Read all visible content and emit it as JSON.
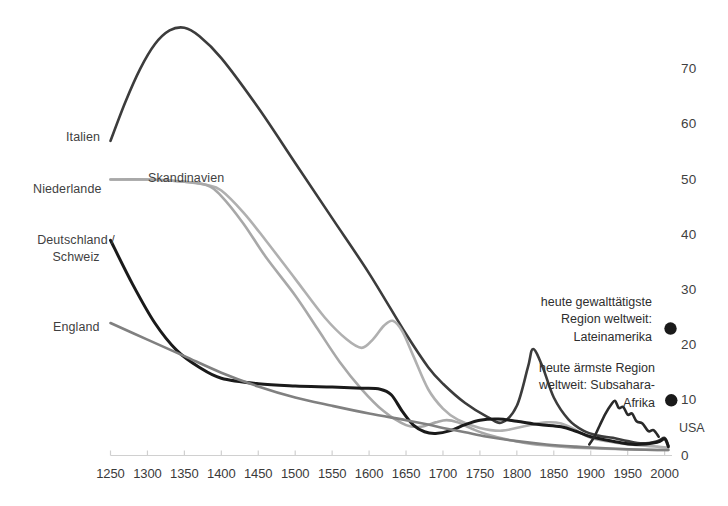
{
  "chart_data": {
    "type": "line",
    "title": "",
    "subtitle": "",
    "xlabel": "",
    "ylabel": "",
    "xlim": [
      1250,
      2010
    ],
    "ylim": [
      0,
      75
    ],
    "grid": false,
    "legend_position": "inline-labels",
    "x_ticks": [
      1250,
      1300,
      1350,
      1400,
      1450,
      1500,
      1550,
      1600,
      1650,
      1700,
      1750,
      1800,
      1850,
      1900,
      1950,
      2000
    ],
    "y_ticks": [
      0,
      10,
      20,
      30,
      40,
      50,
      60,
      70
    ],
    "series": [
      {
        "name": "Italien",
        "color": "#3c3c3c",
        "width": 2.6,
        "label_position": "left",
        "points": [
          [
            1250,
            57
          ],
          [
            1270,
            64
          ],
          [
            1290,
            70
          ],
          [
            1310,
            74.5
          ],
          [
            1330,
            77
          ],
          [
            1350,
            77.5
          ],
          [
            1370,
            76
          ],
          [
            1400,
            72
          ],
          [
            1450,
            63
          ],
          [
            1500,
            53
          ],
          [
            1550,
            43
          ],
          [
            1600,
            33
          ],
          [
            1650,
            22
          ],
          [
            1680,
            16
          ],
          [
            1700,
            13
          ],
          [
            1730,
            9.5
          ],
          [
            1760,
            7
          ],
          [
            1780,
            6
          ],
          [
            1800,
            9
          ],
          [
            1815,
            16
          ],
          [
            1822,
            19.3
          ],
          [
            1835,
            16
          ],
          [
            1850,
            10.5
          ],
          [
            1870,
            6.5
          ],
          [
            1890,
            4.5
          ],
          [
            1910,
            3.6
          ],
          [
            1930,
            3.2
          ],
          [
            1950,
            2.6
          ],
          [
            1970,
            2.2
          ],
          [
            1990,
            2.6
          ],
          [
            2000,
            3.2
          ],
          [
            2005,
            1.8
          ]
        ]
      },
      {
        "name": "Skandinavien",
        "color": "#b0b0b0",
        "width": 2.6,
        "label_position": "above",
        "points": [
          [
            1250,
            50
          ],
          [
            1300,
            50
          ],
          [
            1350,
            49.6
          ],
          [
            1380,
            49
          ],
          [
            1400,
            48
          ],
          [
            1430,
            44
          ],
          [
            1460,
            39
          ],
          [
            1500,
            32
          ],
          [
            1540,
            25
          ],
          [
            1570,
            21
          ],
          [
            1590,
            19.5
          ],
          [
            1605,
            21
          ],
          [
            1620,
            23.5
          ],
          [
            1632,
            24.4
          ],
          [
            1645,
            22.5
          ],
          [
            1660,
            18
          ],
          [
            1680,
            12
          ],
          [
            1700,
            8.5
          ],
          [
            1720,
            6.5
          ],
          [
            1750,
            5
          ],
          [
            1780,
            4.5
          ],
          [
            1810,
            5.3
          ],
          [
            1840,
            6
          ],
          [
            1860,
            5.8
          ],
          [
            1880,
            4.6
          ],
          [
            1900,
            3.2
          ],
          [
            1930,
            2.4
          ],
          [
            1960,
            1.9
          ],
          [
            1990,
            1.6
          ],
          [
            2005,
            1.4
          ]
        ]
      },
      {
        "name": "Niederlande",
        "color": "#a8a8a8",
        "width": 2.6,
        "label_position": "left",
        "points": [
          [
            1250,
            50
          ],
          [
            1300,
            50
          ],
          [
            1350,
            49.6
          ],
          [
            1380,
            49
          ],
          [
            1400,
            47
          ],
          [
            1430,
            42
          ],
          [
            1460,
            36
          ],
          [
            1500,
            29
          ],
          [
            1530,
            23
          ],
          [
            1560,
            17
          ],
          [
            1590,
            12
          ],
          [
            1620,
            8
          ],
          [
            1650,
            5.5
          ],
          [
            1670,
            5.2
          ],
          [
            1690,
            6.0
          ],
          [
            1705,
            6.4
          ],
          [
            1720,
            6.0
          ],
          [
            1740,
            4.8
          ],
          [
            1760,
            3.8
          ],
          [
            1790,
            2.8
          ],
          [
            1820,
            2.1
          ],
          [
            1860,
            1.6
          ],
          [
            1900,
            1.3
          ],
          [
            1950,
            1.1
          ],
          [
            1990,
            1.0
          ],
          [
            2005,
            1.0
          ]
        ]
      },
      {
        "name": "Deutschland / Schweiz",
        "color": "#1a1a1a",
        "width": 3.0,
        "label_position": "left",
        "points": [
          [
            1250,
            39
          ],
          [
            1280,
            31
          ],
          [
            1310,
            24
          ],
          [
            1340,
            19
          ],
          [
            1370,
            16
          ],
          [
            1400,
            14
          ],
          [
            1450,
            13
          ],
          [
            1500,
            12.6
          ],
          [
            1550,
            12.4
          ],
          [
            1590,
            12.2
          ],
          [
            1615,
            12.0
          ],
          [
            1630,
            11.0
          ],
          [
            1645,
            8.0
          ],
          [
            1660,
            5.5
          ],
          [
            1675,
            4.3
          ],
          [
            1690,
            4.0
          ],
          [
            1710,
            4.5
          ],
          [
            1730,
            5.6
          ],
          [
            1750,
            6.4
          ],
          [
            1775,
            6.6
          ],
          [
            1800,
            6.2
          ],
          [
            1830,
            5.6
          ],
          [
            1860,
            5.2
          ],
          [
            1880,
            4.4
          ],
          [
            1900,
            3.4
          ],
          [
            1930,
            2.6
          ],
          [
            1960,
            2.0
          ],
          [
            1990,
            2.4
          ],
          [
            2000,
            3.0
          ],
          [
            2005,
            1.6
          ]
        ]
      },
      {
        "name": "England",
        "color": "#808080",
        "width": 2.6,
        "label_position": "left",
        "points": [
          [
            1250,
            24
          ],
          [
            1300,
            21
          ],
          [
            1350,
            18
          ],
          [
            1400,
            15
          ],
          [
            1450,
            12.5
          ],
          [
            1500,
            10.5
          ],
          [
            1550,
            9.0
          ],
          [
            1600,
            7.6
          ],
          [
            1650,
            6.4
          ],
          [
            1680,
            5.6
          ],
          [
            1700,
            5.0
          ],
          [
            1730,
            4.2
          ],
          [
            1760,
            3.4
          ],
          [
            1800,
            2.6
          ],
          [
            1840,
            2.0
          ],
          [
            1880,
            1.6
          ],
          [
            1920,
            1.3
          ],
          [
            1960,
            1.1
          ],
          [
            1990,
            1.0
          ],
          [
            2005,
            1.0
          ]
        ]
      },
      {
        "name": "USA",
        "color": "#2a2a2a",
        "width": 2.6,
        "label_position": "right",
        "points": [
          [
            1898,
            2.0
          ],
          [
            1905,
            3.4
          ],
          [
            1912,
            5.4
          ],
          [
            1920,
            7.6
          ],
          [
            1928,
            9.3
          ],
          [
            1933,
            9.9
          ],
          [
            1938,
            8.6
          ],
          [
            1944,
            8.8
          ],
          [
            1950,
            7.4
          ],
          [
            1956,
            7.6
          ],
          [
            1962,
            6.2
          ],
          [
            1970,
            5.8
          ],
          [
            1978,
            4.4
          ],
          [
            1985,
            4.6
          ],
          [
            1992,
            3.4
          ]
        ]
      }
    ],
    "annotations": [
      {
        "id": "lateinamerika",
        "lines": [
          "heute gewalttätigste",
          "Region weltweit:",
          "Lateinamerika"
        ],
        "marker": "dot",
        "marker_color": "#1a1a1a",
        "value": 23,
        "value_year": 2008
      },
      {
        "id": "subsahara",
        "lines": [
          "heute ärmste Region",
          "weltweit: Subsahara-",
          "Afrika"
        ],
        "marker": "dot",
        "marker_color": "#1a1a1a",
        "value": 10,
        "value_year": 2009
      }
    ],
    "series_inline_labels": [
      "Italien",
      "Skandinavien",
      "Niederlande",
      "Deutschland /",
      "Schweiz",
      "England",
      "USA"
    ]
  },
  "axis": {
    "x_tick_labels": [
      "1250",
      "1300",
      "1350",
      "1400",
      "1450",
      "1500",
      "1550",
      "1600",
      "1650",
      "1700",
      "1750",
      "1800",
      "1850",
      "1900",
      "1950",
      "2000"
    ],
    "y_tick_labels": [
      "0",
      "10",
      "20",
      "30",
      "40",
      "50",
      "60",
      "70"
    ],
    "axis_color": "#d0d0d0"
  },
  "labels": {
    "italien": "Italien",
    "skandinavien": "Skandinavien",
    "niederlande": "Niederlande",
    "deutschland_line1": "Deutschland /",
    "deutschland_line2": "Schweiz",
    "england": "England",
    "usa": "USA"
  },
  "annotation_text": {
    "lateinamerika_l1": "heute gewalttätigste",
    "lateinamerika_l2": "Region weltweit:",
    "lateinamerika_l3": "Lateinamerika",
    "subsahara_l1": "heute ärmste Region",
    "subsahara_l2": "weltweit: Subsahara-",
    "subsahara_l3": "Afrika"
  },
  "colors": {
    "italien": "#3c3c3c",
    "skandinavien": "#b0b0b0",
    "niederlande": "#a8a8a8",
    "deutschland": "#1a1a1a",
    "england": "#808080",
    "usa": "#2a2a2a",
    "axis": "#d0d0d0",
    "text": "#3a3a3a",
    "background": "#ffffff"
  }
}
